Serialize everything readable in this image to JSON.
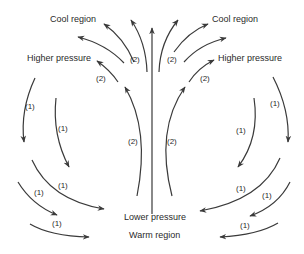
{
  "labels": {
    "cool_region_left": "Cool region",
    "cool_region_right": "Cool region",
    "higher_pressure_left": "Higher pressure",
    "higher_pressure_right": "Higher pressure",
    "lower_pressure": "Lower pressure",
    "warm_region": "Warm region"
  },
  "flow_labels": {
    "upper_left_outer": "(2)",
    "upper_left_inner": "(2)",
    "upper_right_outer": "(2)",
    "upper_right_inner": "(2)",
    "mid_left": "(2)",
    "mid_right": "(2)",
    "left_outer": "(1)",
    "left_inner": "(1)",
    "right_outer": "(1)",
    "right_inner": "(1)",
    "bottom_left_1": "(1)",
    "bottom_left_2": "(1)",
    "bottom_left_3": "(1)",
    "bottom_right_1": "(1)",
    "bottom_right_2": "(1)",
    "bottom_right_3": "(1)"
  },
  "colors": {
    "stroke": "#3a3a3a",
    "text": "#2a2a2a",
    "background": "#ffffff"
  }
}
